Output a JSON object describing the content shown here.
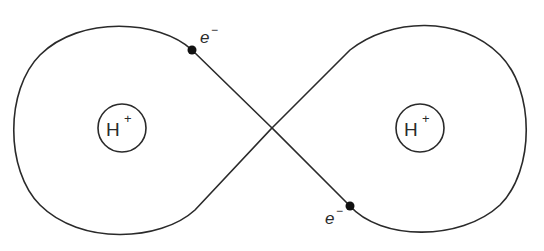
{
  "diagram": {
    "type": "hydrogen-molecule-electron-orbits",
    "colors": {
      "line": "#2a2a2a",
      "electron": "#111111",
      "background": "#ffffff"
    },
    "nuclei": [
      {
        "id": "left",
        "symbol": "H",
        "charge": "+"
      },
      {
        "id": "right",
        "symbol": "H",
        "charge": "+"
      }
    ],
    "electrons": [
      {
        "id": "top-left",
        "symbol": "e",
        "charge": "−"
      },
      {
        "id": "bottom-right",
        "symbol": "e",
        "charge": "−"
      }
    ]
  }
}
